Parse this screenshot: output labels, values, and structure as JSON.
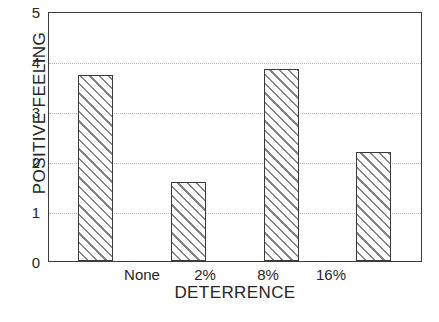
{
  "chart_data": {
    "type": "bar",
    "title": "",
    "subtitle": "",
    "xlabel": "DETERRENCE",
    "ylabel": "POSITIVE FEELING",
    "categories": [
      "None",
      "2%",
      "8%",
      "16%"
    ],
    "values": [
      3.75,
      1.6,
      3.88,
      2.2
    ],
    "ylim": [
      0,
      5
    ],
    "yticks": [
      0,
      1,
      2,
      3,
      4,
      5
    ],
    "ytick_labels": [
      "0",
      "1",
      "2",
      "3",
      "4",
      "5"
    ],
    "gridlines_y": [
      1,
      2,
      3,
      4
    ],
    "grid": true,
    "grid_style": "dotted",
    "legend": null,
    "legend_position": "none",
    "bar_fill": "diagonal-hatch",
    "bar_edge_color": "#3a3a3a",
    "hatch_color": "#6e6e6e",
    "background_color": "#ffffff",
    "axis_color": "#3c3c3c",
    "grid_color": "#b9b9b9"
  }
}
